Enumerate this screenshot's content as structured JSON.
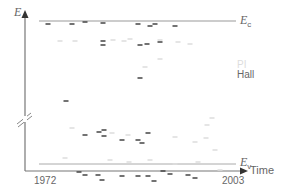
{
  "chart_data": {
    "type": "scatter",
    "title": "",
    "xlabel": "Time",
    "ylabel": "E",
    "x_ticks": [
      "1972",
      "2003"
    ],
    "xlim": [
      1972,
      2003
    ],
    "band_labels": {
      "top": "E_c",
      "bottom": "E_v"
    },
    "axis_break": true,
    "legend": [
      {
        "name": "PI",
        "color": "#dddddd"
      },
      {
        "name": "Hall",
        "color": "#555555"
      }
    ],
    "series": [
      {
        "name": "Hall",
        "color": "#444444",
        "points_px": [
          [
            48,
            24
          ],
          [
            72,
            24
          ],
          [
            85,
            22
          ],
          [
            103,
            23
          ],
          [
            138,
            24
          ],
          [
            150,
            26
          ],
          [
            155,
            24
          ],
          [
            175,
            26
          ],
          [
            103,
            41
          ],
          [
            103,
            45
          ],
          [
            140,
            45
          ],
          [
            147,
            44
          ],
          [
            160,
            42
          ],
          [
            140,
            78
          ],
          [
            66,
            101
          ],
          [
            85,
            135
          ],
          [
            99,
            132
          ],
          [
            104,
            130
          ],
          [
            104,
            136
          ],
          [
            122,
            140
          ],
          [
            138,
            140
          ],
          [
            148,
            133
          ],
          [
            142,
            143
          ],
          [
            79,
            172
          ],
          [
            85,
            175
          ],
          [
            98,
            175
          ],
          [
            102,
            180
          ],
          [
            122,
            176
          ],
          [
            138,
            176
          ],
          [
            148,
            176
          ],
          [
            154,
            181
          ],
          [
            163,
            171
          ],
          [
            170,
            174
          ],
          [
            188,
            175
          ],
          [
            195,
            178
          ]
        ]
      },
      {
        "name": "PI",
        "color": "#dddddd",
        "points_px": [
          [
            60,
            41
          ],
          [
            75,
            41
          ],
          [
            113,
            40
          ],
          [
            124,
            41
          ],
          [
            130,
            39
          ],
          [
            160,
            40
          ],
          [
            178,
            42
          ],
          [
            190,
            44
          ],
          [
            145,
            67
          ],
          [
            160,
            59
          ],
          [
            72,
            128
          ],
          [
            112,
            133
          ],
          [
            128,
            135
          ],
          [
            175,
            137
          ],
          [
            195,
            142
          ],
          [
            206,
            138
          ],
          [
            215,
            150
          ],
          [
            207,
            125
          ],
          [
            212,
            118
          ],
          [
            65,
            158
          ],
          [
            110,
            160
          ],
          [
            129,
            162
          ],
          [
            150,
            160
          ],
          [
            175,
            164
          ],
          [
            198,
            162
          ],
          [
            220,
            170
          ]
        ]
      }
    ]
  },
  "labels": {
    "y_axis": "E",
    "ec_main": "E",
    "ec_sub": "c",
    "ev_main": "E",
    "ev_sub": "v",
    "x_axis": "Time",
    "x_start": "1972",
    "x_end": "2003",
    "legend_pi": "PI",
    "legend_hall": "Hall"
  }
}
